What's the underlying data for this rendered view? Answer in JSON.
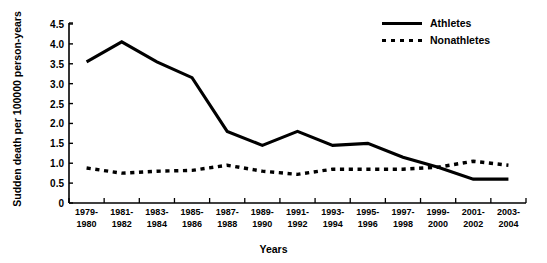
{
  "chart_data": {
    "type": "line",
    "title": "",
    "xlabel": "Years",
    "ylabel": "Sudden death per 100000 person-years",
    "categories": [
      "1979-1980",
      "1981-1982",
      "1983-1984",
      "1985-1986",
      "1987-1988",
      "1989-1990",
      "1991-1992",
      "1993-1994",
      "1995-1996",
      "1997-1998",
      "1999-2000",
      "2001-2002",
      "2003-2004"
    ],
    "ylim": [
      0,
      4.5
    ],
    "yticks": [
      "0",
      "0.5",
      "1.0",
      "1.5",
      "2.0",
      "2.5",
      "3.0",
      "3.5",
      "4.0",
      "4.5"
    ],
    "ytick_values": [
      0,
      0.5,
      1.0,
      1.5,
      2.0,
      2.5,
      3.0,
      3.5,
      4.0,
      4.5
    ],
    "grid": false,
    "legend_position": "top-right",
    "series": [
      {
        "name": "Athletes",
        "style": "solid",
        "color": "#000000",
        "values": [
          3.55,
          4.05,
          3.55,
          3.15,
          1.8,
          1.45,
          1.8,
          1.45,
          1.5,
          1.15,
          0.9,
          0.6,
          0.6
        ]
      },
      {
        "name": "Nonathletes",
        "style": "dotted",
        "color": "#000000",
        "values": [
          0.88,
          0.75,
          0.8,
          0.82,
          0.95,
          0.8,
          0.72,
          0.85,
          0.85,
          0.85,
          0.9,
          1.05,
          0.95
        ]
      }
    ]
  },
  "legend": {
    "items": [
      {
        "label": "Athletes",
        "style": "solid"
      },
      {
        "label": "Nonathletes",
        "style": "dotted"
      }
    ]
  },
  "axes": {
    "x_title": "Years",
    "y_title": "Sudden death per 100000 person-years"
  }
}
